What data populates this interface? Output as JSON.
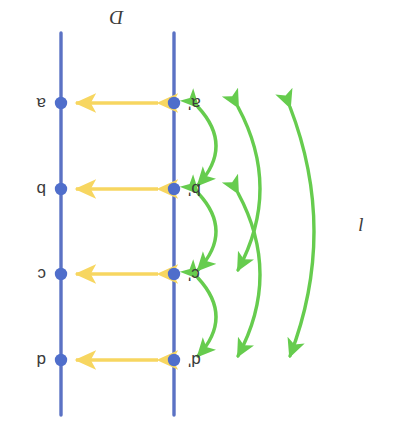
{
  "figure": {
    "orientation_note": "rotated-180",
    "colors": {
      "line_blue": "#5b72c4",
      "dot_blue": "#4f6ecb",
      "arrow_yellow": "#f7d660",
      "arrow_green": "#66cc4e",
      "text": "#3b3b3b",
      "background": "#ffffff"
    },
    "lines": [
      {
        "name": "line-l",
        "label": "l",
        "label_position": "left",
        "x": 220,
        "y_top": 18,
        "y_bottom": 400
      },
      {
        "name": "line-D",
        "label": "D",
        "label_position": "bottom",
        "x": 333,
        "y_top": 18,
        "y_bottom": 400
      }
    ],
    "rows": [
      {
        "y": 73,
        "left_label": "d'",
        "right_label": "d"
      },
      {
        "y": 159,
        "left_label": "c'",
        "right_label": "c"
      },
      {
        "y": 244,
        "left_label": "b'",
        "right_label": "b"
      },
      {
        "y": 330,
        "left_label": "a'",
        "right_label": "a"
      }
    ],
    "horizontal_arrows": [
      {
        "name": "yellow-arrow-d",
        "y": 73,
        "x_start": 236,
        "x_end": 318,
        "double_headed": true
      },
      {
        "name": "yellow-arrow-c",
        "y": 159,
        "x_start": 236,
        "x_end": 318,
        "double_headed": true
      },
      {
        "name": "yellow-arrow-b",
        "y": 244,
        "x_start": 236,
        "x_end": 318,
        "double_headed": true
      },
      {
        "name": "yellow-arrow-a",
        "y": 330,
        "x_start": 236,
        "x_end": 318,
        "double_headed": true
      }
    ],
    "curved_arrows": [
      {
        "name": "green-arc-a-to-b",
        "from_row": 3,
        "to_row": 2,
        "span": 1,
        "bulge": 22,
        "double_headed": true
      },
      {
        "name": "green-arc-b-to-c",
        "from_row": 2,
        "to_row": 1,
        "span": 1,
        "bulge": 22,
        "double_headed": true
      },
      {
        "name": "green-arc-c-to-d",
        "from_row": 1,
        "to_row": 0,
        "span": 1,
        "bulge": 22,
        "double_headed": true
      },
      {
        "name": "green-arc-a-to-c",
        "from_row": 3,
        "to_row": 1,
        "span": 2,
        "bulge": 30,
        "double_headed": true
      },
      {
        "name": "green-arc-b-to-d",
        "from_row": 2,
        "to_row": 0,
        "span": 2,
        "bulge": 30,
        "double_headed": true
      },
      {
        "name": "green-arc-a-to-d",
        "from_row": 3,
        "to_row": 0,
        "span": 3,
        "bulge": 34,
        "double_headed": true
      }
    ]
  }
}
